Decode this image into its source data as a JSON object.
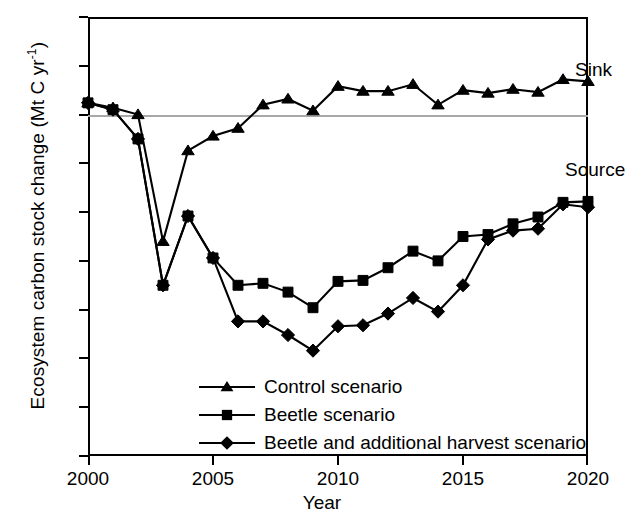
{
  "chart_data": {
    "type": "line",
    "title": "",
    "xlabel": "Year",
    "ylabel": "Ecosystem carbon stock change (Mt C yr-1)",
    "ylabel_main": "Ecosystem carbon stock change (Mt C yr",
    "ylabel_sup": "-1",
    "ylabel_tail": ")",
    "xlim": [
      2000,
      2020
    ],
    "ylim": [
      -35,
      10
    ],
    "grid": false,
    "zero_line": true,
    "legend_position": "lower left inside",
    "x": [
      2000,
      2001,
      2002,
      2003,
      2004,
      2005,
      2006,
      2007,
      2008,
      2009,
      2010,
      2011,
      2012,
      2013,
      2014,
      2015,
      2016,
      2017,
      2018,
      2019,
      2020
    ],
    "xticks": [
      2000,
      2005,
      2010,
      2015,
      2020
    ],
    "xticklabels": [
      "2000",
      "2005",
      "2010",
      "2015",
      "2020"
    ],
    "yticks": [
      10,
      5,
      0,
      -5,
      -10,
      -15,
      -20,
      -25,
      -30,
      -35
    ],
    "yticklabels": [
      "10",
      "5",
      "0",
      "-5",
      "-10",
      "-15",
      "-20",
      "-25",
      "-30",
      "-35"
    ],
    "annotations": [
      {
        "text": "Sink",
        "x": 2016.0,
        "y": 7.0
      },
      {
        "text": "Source",
        "x": 2015.6,
        "y": -3.4
      }
    ],
    "series": [
      {
        "name": "Control scenario",
        "marker": "triangle",
        "values": [
          1.2,
          0.7,
          0.0,
          -13.0,
          -3.7,
          -2.2,
          -1.4,
          1.0,
          1.6,
          0.4,
          2.9,
          2.4,
          2.4,
          3.1,
          1.0,
          2.5,
          2.2,
          2.6,
          2.3,
          3.6,
          3.4
        ]
      },
      {
        "name": "Beetle scenario",
        "marker": "square",
        "values": [
          1.2,
          0.5,
          -2.5,
          -17.5,
          -10.4,
          -14.7,
          -17.5,
          -17.3,
          -18.2,
          -19.8,
          -17.1,
          -17.0,
          -15.7,
          -14.0,
          -15.0,
          -12.5,
          -12.3,
          -11.2,
          -10.5,
          -9.0,
          -8.9
        ]
      },
      {
        "name": "Beetle and additional harvest scenario",
        "marker": "diamond",
        "values": [
          1.2,
          0.5,
          -2.5,
          -17.5,
          -10.4,
          -14.7,
          -21.2,
          -21.2,
          -22.6,
          -24.2,
          -21.7,
          -21.6,
          -20.4,
          -18.8,
          -20.2,
          -17.5,
          -12.8,
          -11.9,
          -11.7,
          -9.2,
          -9.5
        ]
      }
    ]
  },
  "legend": {
    "items": [
      {
        "label": "Control scenario",
        "marker": "triangle"
      },
      {
        "label": "Beetle scenario",
        "marker": "square"
      },
      {
        "label": "Beetle and additional harvest scenario",
        "marker": "diamond"
      }
    ]
  }
}
